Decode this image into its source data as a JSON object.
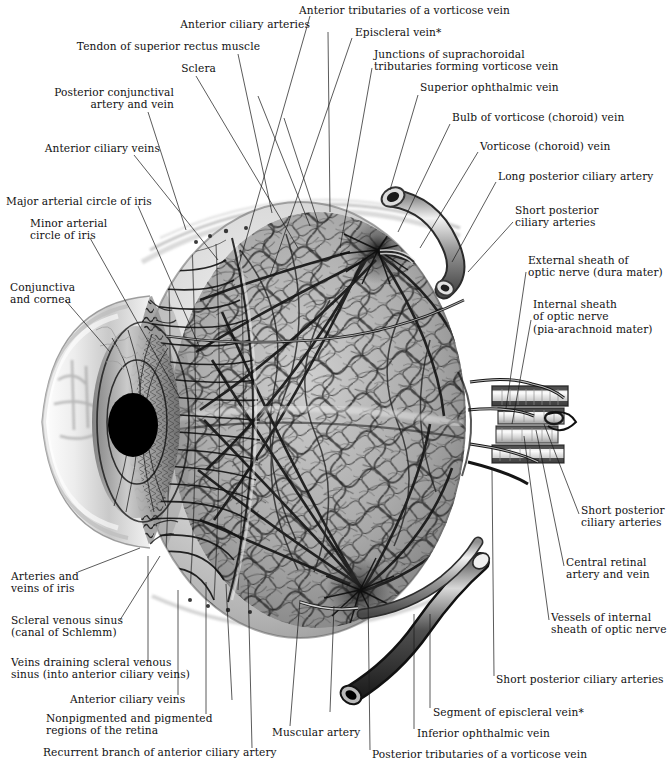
{
  "plate": {
    "title": "Blood Supply of Eye",
    "background": "#ffffff",
    "ink": "#111111",
    "footnote_marker": "*"
  },
  "labels": [
    {
      "id": "anterior-ciliary-arteries",
      "text": "Anterior ciliary arteries",
      "x": 166,
      "y": 24,
      "align": "left"
    },
    {
      "id": "tendon-of-superior-rectus-muscle",
      "text": "Tendon of superior rectus muscle",
      "x": 72,
      "y": 46,
      "align": "left"
    },
    {
      "id": "sclera",
      "text": "Sclera",
      "x": 163,
      "y": 68,
      "align": "left"
    },
    {
      "id": "posterior-conjunctival-artery-and-vein",
      "text": "Posterior conjunctival\nartery and vein",
      "x": 38,
      "y": 92,
      "align": "right"
    },
    {
      "id": "anterior-ciliary-veins-top",
      "text": "Anterior ciliary veins",
      "x": 27,
      "y": 148,
      "align": "left"
    },
    {
      "id": "major-arterial-circle-of-iris",
      "text": "Major arterial circle of iris",
      "x": 8,
      "y": 200,
      "align": "left"
    },
    {
      "id": "minor-arterial-circle-of-iris",
      "text": "Minor arterial\ncircle of iris",
      "x": 30,
      "y": 222,
      "align": "left"
    },
    {
      "id": "conjunctiva-and-cornea",
      "text": "Conjunctiva\nand cornea",
      "x": 12,
      "y": 285,
      "align": "left"
    },
    {
      "id": "anterior-tributaries-of-a-vorticose-vein",
      "text": "Anterior tributaries of a vorticose vein",
      "x": 297,
      "y": 8,
      "align": "left"
    },
    {
      "id": "episcleral-vein-top",
      "text": "Episcleral vein*",
      "x": 356,
      "y": 30,
      "align": "left"
    },
    {
      "id": "junctions-of-suprachoroidal-tributaries",
      "text": "Junctions of suprachoroidal\ntributaries forming vorticose vein",
      "x": 374,
      "y": 52,
      "align": "left"
    },
    {
      "id": "superior-ophthalmic-vein",
      "text": "Superior ophthalmic vein",
      "x": 420,
      "y": 85,
      "align": "left"
    },
    {
      "id": "bulb-of-vorticose-choroid-vein",
      "text": "Bulb of vorticose (choroid) vein",
      "x": 452,
      "y": 115,
      "align": "left"
    },
    {
      "id": "vorticose-choroid-vein",
      "text": "Vorticose (choroid) vein",
      "x": 480,
      "y": 144,
      "align": "left"
    },
    {
      "id": "long-posterior-ciliary-artery",
      "text": "Long posterior ciliary artery",
      "x": 498,
      "y": 174,
      "align": "left"
    },
    {
      "id": "short-posterior-ciliary-arteries-upper",
      "text": "Short posterior\nciliary arteries",
      "x": 515,
      "y": 208,
      "align": "left"
    },
    {
      "id": "external-sheath-of-optic-nerve",
      "text": "External sheath of\noptic nerve (dura mater)",
      "x": 528,
      "y": 258,
      "align": "left"
    },
    {
      "id": "internal-sheath-of-optic-nerve",
      "text": "Internal sheath\nof optic nerve\n(pia-arachnoid mater)",
      "x": 533,
      "y": 302,
      "align": "left"
    },
    {
      "id": "short-posterior-ciliary-arteries-right",
      "text": "Short posterior\nciliary arteries",
      "x": 581,
      "y": 508,
      "align": "left"
    },
    {
      "id": "central-retinal-artery-and-vein",
      "text": "Central retinal\nartery and vein",
      "x": 566,
      "y": 560,
      "align": "left"
    },
    {
      "id": "vessels-of-internal-sheath-of-optic-nerve",
      "text": "Vessels of internal\nsheath of optic nerve",
      "x": 551,
      "y": 615,
      "align": "left"
    },
    {
      "id": "short-posterior-ciliary-arteries-bottom",
      "text": "Short posterior ciliary arteries",
      "x": 496,
      "y": 677,
      "align": "left"
    },
    {
      "id": "segment-of-episcleral-vein",
      "text": "Segment of episcleral vein*",
      "x": 433,
      "y": 710,
      "align": "left"
    },
    {
      "id": "inferior-ophthalmic-vein",
      "text": "Inferior ophthalmic vein",
      "x": 417,
      "y": 731,
      "align": "left"
    },
    {
      "id": "posterior-tributaries-of-a-vorticose-vein",
      "text": "Posterior tributaries of a vorticose vein",
      "x": 372,
      "y": 752,
      "align": "left"
    },
    {
      "id": "muscular-artery",
      "text": "Muscular artery",
      "x": 272,
      "y": 730,
      "align": "left"
    },
    {
      "id": "arteries-and-veins-of-iris",
      "text": "Arteries and\nveins of iris",
      "x": 11,
      "y": 574,
      "align": "left"
    },
    {
      "id": "scleral-venous-sinus",
      "text": "Scleral venous sinus\n(canal of Schlemm)",
      "x": 11,
      "y": 618,
      "align": "left"
    },
    {
      "id": "veins-draining-scleral-venous-sinus",
      "text": "Veins draining scleral venous\nsinus (into anterior ciliary veins)",
      "x": 11,
      "y": 660,
      "align": "left"
    },
    {
      "id": "anterior-ciliary-veins-bottom",
      "text": "Anterior ciliary veins",
      "x": 70,
      "y": 697,
      "align": "left"
    },
    {
      "id": "nonpigmented-and-pigmented-regions",
      "text": "Nonpigmented and pigmented\nregions of the retina",
      "x": 46,
      "y": 716,
      "align": "left"
    },
    {
      "id": "recurrent-branch-of-anterior-ciliary-artery",
      "text": "Recurrent branch of anterior ciliary artery",
      "x": 43,
      "y": 750,
      "align": "left"
    }
  ],
  "leaders": [
    {
      "id": "leader-anterior-ciliary-arteries",
      "x1": 328,
      "y1": 32,
      "x2": 330,
      "y2": 212
    },
    {
      "id": "leader-tendon-of-superior-rectus",
      "x1": 238,
      "y1": 54,
      "x2": 272,
      "y2": 213
    },
    {
      "id": "leader-sclera",
      "x1": 196,
      "y1": 76,
      "x2": 298,
      "y2": 248
    },
    {
      "id": "leader-posterior-conjunctival",
      "x1": 148,
      "y1": 112,
      "x2": 186,
      "y2": 230
    },
    {
      "id": "leader-anterior-ciliary-veins-top",
      "x1": 134,
      "y1": 155,
      "x2": 218,
      "y2": 260
    },
    {
      "id": "leader-major-arterial-circle",
      "x1": 138,
      "y1": 206,
      "x2": 200,
      "y2": 348
    },
    {
      "id": "leader-minor-arterial-circle",
      "x1": 90,
      "y1": 238,
      "x2": 180,
      "y2": 398
    },
    {
      "id": "leader-conjunctiva-and-cornea",
      "x1": 65,
      "y1": 300,
      "x2": 110,
      "y2": 352
    },
    {
      "id": "leader-anterior-tributaries",
      "x1": 310,
      "y1": 16,
      "x2": 238,
      "y2": 268
    },
    {
      "id": "leader-episcleral-vein-top",
      "x1": 352,
      "y1": 38,
      "x2": 270,
      "y2": 276
    },
    {
      "id": "leader-junctions-suprachoroidal",
      "x1": 372,
      "y1": 68,
      "x2": 340,
      "y2": 248
    },
    {
      "id": "leader-superior-ophthalmic-vein",
      "x1": 418,
      "y1": 95,
      "x2": 390,
      "y2": 190
    },
    {
      "id": "leader-bulb-of-vorticose",
      "x1": 450,
      "y1": 124,
      "x2": 398,
      "y2": 232
    },
    {
      "id": "leader-vorticose-choroid-vein",
      "x1": 478,
      "y1": 152,
      "x2": 420,
      "y2": 248
    },
    {
      "id": "leader-long-posterior-ciliary",
      "x1": 496,
      "y1": 182,
      "x2": 452,
      "y2": 262
    },
    {
      "id": "leader-short-posterior-upper",
      "x1": 513,
      "y1": 222,
      "x2": 468,
      "y2": 272
    },
    {
      "id": "leader-external-sheath",
      "x1": 526,
      "y1": 272,
      "x2": 506,
      "y2": 408
    },
    {
      "id": "leader-internal-sheath",
      "x1": 531,
      "y1": 320,
      "x2": 512,
      "y2": 424
    },
    {
      "id": "leader-short-posterior-right",
      "x1": 579,
      "y1": 514,
      "x2": 544,
      "y2": 424
    },
    {
      "id": "leader-central-retinal",
      "x1": 564,
      "y1": 566,
      "x2": 536,
      "y2": 430
    },
    {
      "id": "leader-vessels-internal-sheath",
      "x1": 549,
      "y1": 620,
      "x2": 524,
      "y2": 436
    },
    {
      "id": "leader-short-posterior-bottom",
      "x1": 494,
      "y1": 676,
      "x2": 492,
      "y2": 470
    },
    {
      "id": "leader-segment-episcleral",
      "x1": 430,
      "y1": 708,
      "x2": 430,
      "y2": 614
    },
    {
      "id": "leader-inferior-ophthalmic",
      "x1": 414,
      "y1": 729,
      "x2": 414,
      "y2": 614
    },
    {
      "id": "leader-posterior-tributaries",
      "x1": 370,
      "y1": 750,
      "x2": 368,
      "y2": 594
    },
    {
      "id": "leader-muscular-artery",
      "x1": 290,
      "y1": 726,
      "x2": 300,
      "y2": 600
    },
    {
      "id": "leader-arteries-veins-of-iris",
      "x1": 78,
      "y1": 572,
      "x2": 140,
      "y2": 548
    },
    {
      "id": "leader-scleral-venous-sinus",
      "x1": 120,
      "y1": 620,
      "x2": 160,
      "y2": 556
    },
    {
      "id": "leader-veins-draining",
      "x1": 148,
      "y1": 662,
      "x2": 148,
      "y2": 556
    },
    {
      "id": "leader-anterior-ciliary-veins-bottom",
      "x1": 178,
      "y1": 695,
      "x2": 178,
      "y2": 590
    },
    {
      "id": "leader-nonpigmented-pigmented",
      "x1": 206,
      "y1": 714,
      "x2": 206,
      "y2": 582
    },
    {
      "id": "leader-recurrent-branch",
      "x1": 252,
      "y1": 748,
      "x2": 248,
      "y2": 580
    }
  ],
  "anatomy": {
    "globe": {
      "cx": 300,
      "cy": 420,
      "rx": 165,
      "ry": 218
    },
    "pupil": {
      "cx": 133,
      "cy": 425,
      "rx": 25,
      "ry": 32,
      "color": "#000000"
    },
    "cornea_label": "cornea-bulge",
    "iris_label": "iris-striations",
    "ciliary_label": "ciliary-body-radial-vessels",
    "choroid_label": "choroid-vascular-mesh",
    "optic_nerve": {
      "x": 490,
      "y": 388,
      "w": 78,
      "h": 68
    },
    "vorticose_star_upper": {
      "cx": 378,
      "cy": 248
    },
    "vorticose_star_lower": {
      "cx": 360,
      "cy": 590
    },
    "superior_ophthalmic_tube": {
      "from_x": 388,
      "from_y": 186,
      "to_x": 452,
      "to_y": 268
    },
    "inferior_ophthalmic_tube": {
      "from_x": 352,
      "from_y": 690,
      "to_x": 470,
      "to_y": 556
    }
  }
}
